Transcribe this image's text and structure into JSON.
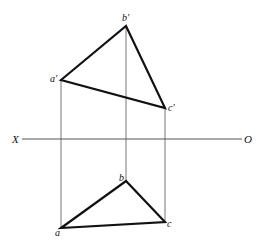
{
  "diagram": {
    "axis": {
      "left_label": "X",
      "right_label": "O",
      "y": 139,
      "x1": 22,
      "x2": 242,
      "color": "#555555"
    },
    "projection_lines_color": "#777777",
    "edge_color": "#111111",
    "front_view": {
      "vertices": [
        {
          "id": "a_prime",
          "label": "a′",
          "x": 61,
          "y": 80,
          "lx": 50,
          "ly": 82
        },
        {
          "id": "b_prime",
          "label": "b′",
          "x": 126,
          "y": 26,
          "lx": 122,
          "ly": 21
        },
        {
          "id": "c_prime",
          "label": "c′",
          "x": 165,
          "y": 108,
          "lx": 168,
          "ly": 111
        }
      ]
    },
    "top_view": {
      "vertices": [
        {
          "id": "a",
          "label": "a",
          "x": 61,
          "y": 228,
          "lx": 55,
          "ly": 236
        },
        {
          "id": "b",
          "label": "b",
          "x": 126,
          "y": 181,
          "lx": 119,
          "ly": 181
        },
        {
          "id": "c",
          "label": "c",
          "x": 165,
          "y": 222,
          "lx": 167,
          "ly": 227
        }
      ]
    }
  }
}
